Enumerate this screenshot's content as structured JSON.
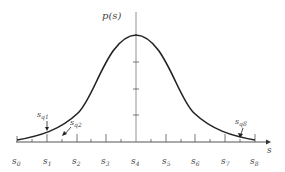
{
  "diagram": {
    "title": "",
    "y_axis_label": "p(s)",
    "x_axis_label": "s",
    "curve": "gaussian probability density p(s)",
    "x_tick_labels": [
      {
        "base": "s",
        "sub": "0"
      },
      {
        "base": "s",
        "sub": "1"
      },
      {
        "base": "s",
        "sub": "2"
      },
      {
        "base": "s",
        "sub": "3"
      },
      {
        "base": "s",
        "sub": "4"
      },
      {
        "base": "s",
        "sub": "5"
      },
      {
        "base": "s",
        "sub": "6"
      },
      {
        "base": "s",
        "sub": "7"
      },
      {
        "base": "s",
        "sub": "8"
      }
    ],
    "annotations": [
      {
        "base": "s",
        "sub": "q1"
      },
      {
        "base": "s",
        "sub": "q2"
      },
      {
        "base": "s",
        "sub": "q8"
      }
    ],
    "y_ticks": 3,
    "colors": {
      "axis": "#555555",
      "curve": "#222222",
      "text": "#444444"
    }
  }
}
